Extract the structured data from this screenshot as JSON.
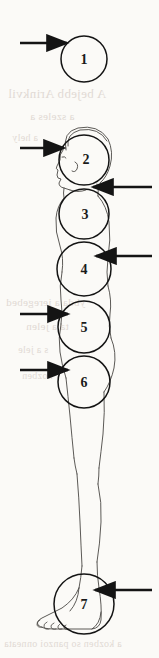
{
  "page": {
    "width": 159,
    "height": 658,
    "background_color": "#fbfaf7",
    "ink_color": "#1a1a1a",
    "bleed_color": "#b9a9a0"
  },
  "diagram": {
    "type": "anatomical-proportion-overlay",
    "orientation": "side-view-facing-left",
    "unit_count": 7,
    "circles": [
      {
        "id": 1,
        "label": "1",
        "cx": 84,
        "cy": 59,
        "r": 23,
        "label_x": 84,
        "label_y": 61
      },
      {
        "id": 2,
        "label": "2",
        "cx": 84,
        "cy": 160,
        "r": 25,
        "label_x": 86,
        "label_y": 161
      },
      {
        "id": 3,
        "label": "3",
        "cx": 84,
        "cy": 214,
        "r": 25,
        "label_x": 85,
        "label_y": 216
      },
      {
        "id": 4,
        "label": "4",
        "cx": 84,
        "cy": 269,
        "r": 27,
        "label_x": 84,
        "label_y": 271
      },
      {
        "id": 5,
        "label": "5",
        "cx": 84,
        "cy": 327,
        "r": 26,
        "label_x": 84,
        "label_y": 329
      },
      {
        "id": 6,
        "label": "6",
        "cx": 84,
        "cy": 382,
        "r": 26,
        "label_x": 84,
        "label_y": 384
      },
      {
        "id": 7,
        "label": "7",
        "cx": 84,
        "cy": 604,
        "r": 30,
        "label_x": 84,
        "label_y": 606
      }
    ],
    "arrows": [
      {
        "id": "arrow-1",
        "target_circle": 1,
        "side": "left",
        "x1": 20,
        "y1": 43,
        "x2": 67,
        "y2": 43
      },
      {
        "id": "arrow-2",
        "target_circle": 2,
        "side": "left",
        "x1": 20,
        "y1": 148,
        "x2": 64,
        "y2": 148
      },
      {
        "id": "arrow-3",
        "target_circle": 3,
        "side": "right",
        "x1": 152,
        "y1": 187,
        "x2": 93,
        "y2": 187
      },
      {
        "id": "arrow-4",
        "target_circle": 4,
        "side": "right",
        "x1": 152,
        "y1": 256,
        "x2": 96,
        "y2": 256
      },
      {
        "id": "arrow-5",
        "target_circle": 5,
        "side": "left",
        "x1": 20,
        "y1": 314,
        "x2": 68,
        "y2": 314
      },
      {
        "id": "arrow-6",
        "target_circle": 6,
        "side": "left",
        "x1": 20,
        "y1": 370,
        "x2": 68,
        "y2": 370
      },
      {
        "id": "arrow-7",
        "target_circle": 7,
        "side": "right",
        "x1": 152,
        "y1": 590,
        "x2": 95,
        "y2": 590
      }
    ],
    "body_parts": [
      "head-profile",
      "hair-outline",
      "neck",
      "chest-back-contour",
      "abdomen-contour",
      "hip-contour",
      "thigh",
      "knee",
      "calf",
      "ankle",
      "foot-with-toes"
    ]
  },
  "bleed_through": [
    {
      "id": "bleed-1",
      "text": "A bejebb Arinkvil",
      "x": 8,
      "y": 86,
      "size": 13
    },
    {
      "id": "bleed-2",
      "text": "a szeles a",
      "x": 30,
      "y": 110,
      "size": 11
    },
    {
      "id": "bleed-3",
      "text": "a hely",
      "x": 12,
      "y": 132,
      "size": 10
    },
    {
      "id": "bleed-4",
      "text": "ybda a ieregebed",
      "x": 6,
      "y": 296,
      "size": 11
    },
    {
      "id": "bleed-5",
      "text": "ta a jelen",
      "x": 26,
      "y": 320,
      "size": 11
    },
    {
      "id": "bleed-6",
      "text": "s a jele",
      "x": 18,
      "y": 344,
      "size": 10
    },
    {
      "id": "bleed-7",
      "text": "kozben",
      "x": 22,
      "y": 370,
      "size": 10
    },
    {
      "id": "bleed-8",
      "text": "a kozben so panzoi onneata",
      "x": 4,
      "y": 638,
      "size": 10
    }
  ]
}
